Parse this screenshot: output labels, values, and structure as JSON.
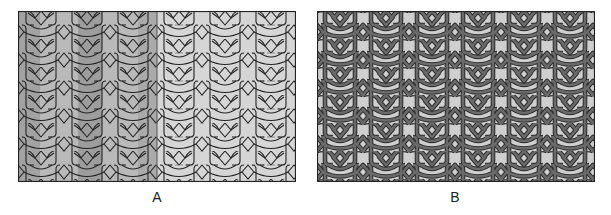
{
  "figure": {
    "panels": [
      {
        "id": "A",
        "label": "A",
        "description": "Interlaced geometric star pattern drawn as thin line-work, left section shaded with darker gray vertical bands, right section light gray with dashed guide lines",
        "colors": {
          "background": "#d6d6d6",
          "shade_light": "#b9b9b9",
          "shade_dark": "#9d9d9d",
          "line": "#222222",
          "guide": "#777777"
        }
      },
      {
        "id": "B",
        "label": "B",
        "description": "Same geometric pattern rendered as interwoven strapwork bands in dark gray on light gray background",
        "colors": {
          "background": "#cfcfcf",
          "strap": "#5a5a5a",
          "strap_edge": "#2a2a2a"
        }
      }
    ]
  }
}
